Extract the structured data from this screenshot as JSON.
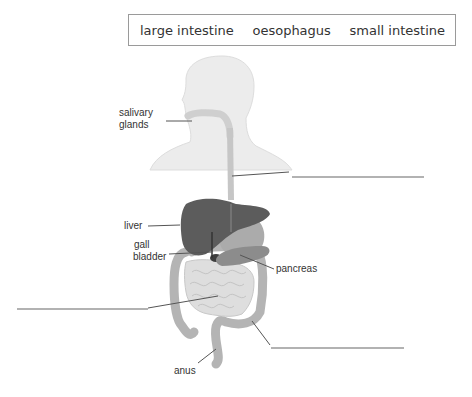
{
  "word_bank": {
    "words": [
      "large intestine",
      "oesophagus",
      "small intestine"
    ]
  },
  "labels": {
    "salivary_glands_line1": "salivary",
    "salivary_glands_line2": "glands",
    "liver": "liver",
    "gall_bladder_line1": "gall",
    "gall_bladder_line2": "bladder",
    "pancreas": "pancreas",
    "anus": "anus"
  },
  "blanks": [
    {
      "id": "blank-oesophagus-answer",
      "value": ""
    },
    {
      "id": "blank-small-intestine-answer",
      "value": ""
    },
    {
      "id": "blank-large-intestine-answer",
      "value": ""
    }
  ],
  "colors": {
    "body_outline": "#e8e8e8",
    "oesophagus": "#c8c8c8",
    "liver": "#5a5a5a",
    "stomach": "#a8a8a8",
    "pancreas": "#8a8a8a",
    "large_intestine": "#b4b4b4",
    "small_intestine": "#dcdcdc",
    "leader_line": "#555555"
  }
}
